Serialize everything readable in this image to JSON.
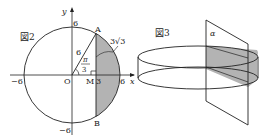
{
  "figure2": {
    "title": "図2",
    "axis_x": "x",
    "axis_y": "y",
    "origin": "O",
    "point_A": "A",
    "point_B": "B",
    "point_M": "M",
    "tick_x_pos": "6",
    "tick_x_neg": "−6",
    "tick_y_pos": "6",
    "tick_y_neg": "−6",
    "tick_M": "3",
    "radius_label": "6",
    "angle_num": "π",
    "angle_den": "3",
    "segment_label": "3√3",
    "shade_color": "#b3b3b3"
  },
  "figure3": {
    "title": "図3",
    "plane_label": "α",
    "shade_color": "#b3b3b3"
  }
}
